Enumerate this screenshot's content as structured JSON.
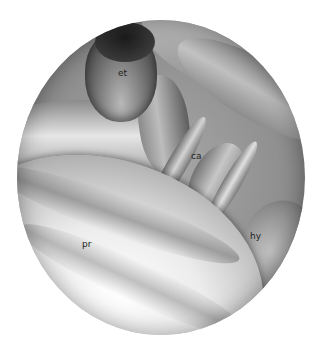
{
  "figure": {
    "labels": [
      {
        "id": "et",
        "text": "et",
        "x": 118,
        "y": 69
      },
      {
        "id": "ca",
        "text": "ca",
        "x": 191,
        "y": 152
      },
      {
        "id": "hy",
        "text": "hy",
        "x": 250,
        "y": 232
      },
      {
        "id": "pr",
        "text": "pr",
        "x": 82,
        "y": 240
      }
    ],
    "colors": {
      "background": "#ffffff",
      "label": "#222222"
    }
  }
}
